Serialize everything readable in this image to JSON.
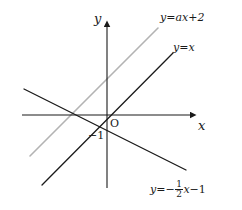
{
  "figure": {
    "kind": "coordinate-plane-line-graph",
    "width": 242,
    "height": 210,
    "background": "#ffffff"
  },
  "axes": {
    "x_label": "x",
    "y_label": "y",
    "origin_label": "O",
    "color": "#1a1a1a",
    "origin_px": {
      "x": 107,
      "y": 115
    },
    "x_axis": {
      "x_start": 22,
      "x_end": 196,
      "y": 115
    },
    "y_axis": {
      "x": 107,
      "y_start": 22,
      "y_end": 188
    }
  },
  "ticks": [
    {
      "name": "y-intercept-minus-one",
      "label": "−1",
      "axis": "y",
      "value": -1,
      "px": {
        "x": 90,
        "y": 137
      }
    }
  ],
  "lines": [
    {
      "name": "line-y-equals-ax-plus-2",
      "color": "#b3b3b3",
      "width": 1.6,
      "label": {
        "prefix": "y=",
        "body": "ax+2",
        "px": {
          "x": 162,
          "y": 17
        }
      },
      "endpoints": {
        "x1": 30,
        "y1": 156,
        "x2": 158,
        "y2": 28
      }
    },
    {
      "name": "line-y-equals-x",
      "color": "#1a1a1a",
      "width": 1.4,
      "label": {
        "prefix": "y=",
        "body": "x",
        "px": {
          "x": 175,
          "y": 48
        }
      },
      "endpoints": {
        "x1": 42,
        "y1": 185,
        "x2": 173,
        "y2": 53
      }
    },
    {
      "name": "line-y-equals-minus-half-x-minus-1",
      "color": "#1a1a1a",
      "width": 1.4,
      "label": {
        "prefix": "y=",
        "sign": "−",
        "fraction_numerator": "1",
        "fraction_denominator": "2",
        "variable": "x",
        "constant": "−1",
        "px": {
          "x": 150,
          "y": 184
        }
      },
      "endpoints": {
        "x1": 24,
        "y1": 89,
        "x2": 186,
        "y2": 170
      }
    }
  ],
  "equations": {
    "gray_line": "y=ax+2",
    "identity_line": "y=x",
    "decreasing_line": "y=-1/2x-1"
  }
}
